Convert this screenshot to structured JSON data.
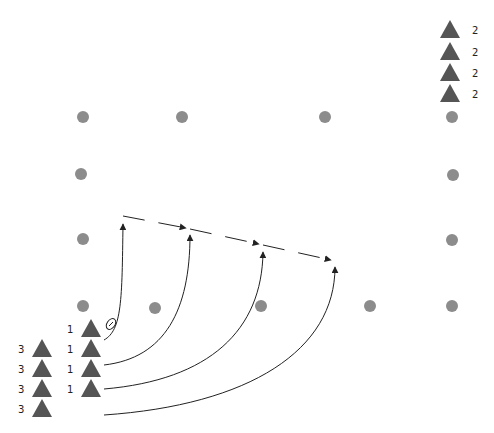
{
  "diagram": {
    "type": "football drill",
    "colors": {
      "cone": "#8c8c8c",
      "player": "#555555",
      "line": "#222222",
      "background": "#ffffff"
    },
    "legend_top_right": [
      {
        "icon": "player-triangle",
        "label": "2",
        "x": 450,
        "y": 30
      },
      {
        "icon": "player-triangle",
        "label": "2",
        "x": 450,
        "y": 52
      },
      {
        "icon": "player-triangle",
        "label": "2",
        "x": 450,
        "y": 73
      },
      {
        "icon": "player-triangle",
        "label": "2",
        "x": 450,
        "y": 94
      }
    ],
    "cones": [
      {
        "x": 83,
        "y": 117
      },
      {
        "x": 182,
        "y": 117
      },
      {
        "x": 325,
        "y": 117
      },
      {
        "x": 452,
        "y": 117
      },
      {
        "x": 81,
        "y": 174
      },
      {
        "x": 453,
        "y": 175
      },
      {
        "x": 83,
        "y": 239
      },
      {
        "x": 452,
        "y": 240
      },
      {
        "x": 83,
        "y": 306
      },
      {
        "x": 155,
        "y": 308
      },
      {
        "x": 261,
        "y": 306
      },
      {
        "x": 370,
        "y": 306
      },
      {
        "x": 452,
        "y": 306
      }
    ],
    "left_group": [
      {
        "label": "3",
        "x": 42,
        "y": 349
      },
      {
        "label": "3",
        "x": 42,
        "y": 369
      },
      {
        "label": "3",
        "x": 42,
        "y": 389
      },
      {
        "label": "3",
        "x": 42,
        "y": 409
      }
    ],
    "front_group": [
      {
        "label": "1",
        "x": 91,
        "y": 329
      },
      {
        "label": "1",
        "x": 91,
        "y": 349
      },
      {
        "label": "1",
        "x": 91,
        "y": 369
      },
      {
        "label": "1",
        "x": 91,
        "y": 389
      }
    ],
    "ball": {
      "x": 111,
      "y": 324
    },
    "runs": [
      {
        "path": "M104,340 C122,330 122,300 123,224"
      },
      {
        "path": "M104,365 C165,358 190,310 190,235"
      },
      {
        "path": "M104,389 C210,380 262,330 263,252"
      },
      {
        "path": "M104,415 C250,405 335,350 335,267"
      }
    ],
    "passes": [
      {
        "x1": 123,
        "y1": 216,
        "x2": 190,
        "y2": 229
      },
      {
        "x1": 190,
        "y1": 229,
        "x2": 263,
        "y2": 245
      },
      {
        "x1": 263,
        "y1": 245,
        "x2": 335,
        "y2": 261
      }
    ]
  }
}
